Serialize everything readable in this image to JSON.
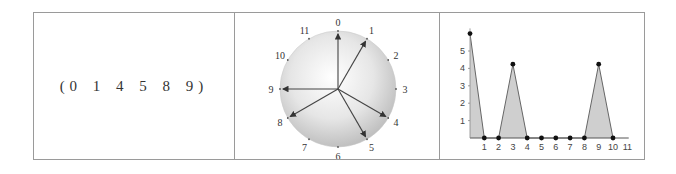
{
  "set_cell": {
    "text": "(0 1 4 5 8 9)"
  },
  "clock_diagram": {
    "pitch_classes": [
      "0",
      "1",
      "2",
      "3",
      "4",
      "5",
      "6",
      "7",
      "8",
      "9",
      "10",
      "11"
    ],
    "arrows_to": [
      0,
      1,
      4,
      5,
      8,
      9
    ],
    "fill_color": "#d4d4d4",
    "arrow_color": "#444444"
  },
  "chart_data": {
    "type": "area",
    "title": "",
    "xlabel": "",
    "ylabel": "",
    "x": [
      0,
      1,
      2,
      3,
      4,
      5,
      6,
      7,
      8,
      9,
      10
    ],
    "values": [
      6,
      0,
      0,
      4.24,
      0,
      0,
      0,
      0,
      0,
      4.24,
      0
    ],
    "x_tick_labels": [
      "1",
      "2",
      "3",
      "4",
      "5",
      "6",
      "7",
      "8",
      "9",
      "10",
      "11"
    ],
    "y_tick_labels": [
      "1",
      "2",
      "3",
      "4",
      "5"
    ],
    "xlim": [
      0,
      11
    ],
    "ylim": [
      0,
      6.3
    ],
    "grid": false,
    "fill_color": "#cfcfcf",
    "line_color": "#666666",
    "marker_color": "#111111"
  }
}
